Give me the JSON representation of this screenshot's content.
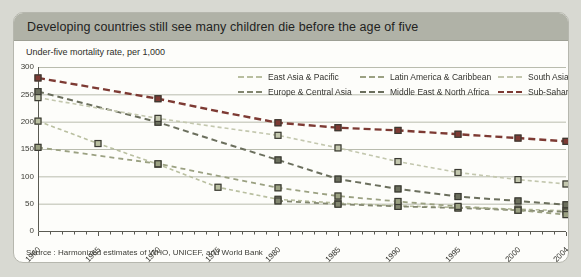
{
  "page": {
    "background": "#d8d9d2"
  },
  "header": {
    "title": "Developing countries still see many children die before the age of five"
  },
  "subtitle": "Under-five mortality rate, per 1,000",
  "source": "Source : Harmonized estimates of WHO, UNICEF, and World Bank",
  "chart_data": {
    "type": "line",
    "title": "Developing countries still see many children die before the age of five",
    "ylabel": "Under-five mortality rate, per 1,000",
    "xlabel": "",
    "x": [
      1960,
      1965,
      1970,
      1975,
      1980,
      1985,
      1990,
      1995,
      2000,
      2004
    ],
    "x_tick_labels": [
      "1960",
      "1965",
      "1970",
      "1975",
      "1980",
      "1985",
      "1990",
      "1995",
      "2000",
      "2004"
    ],
    "x_minor_tick_step": 1,
    "x_range": [
      1960,
      2004
    ],
    "ylim": [
      0,
      300
    ],
    "yticks": [
      0,
      50,
      100,
      150,
      200,
      250,
      300
    ],
    "grid": true,
    "grid_color": "#b9bcae",
    "axis_color": "#5a5a52",
    "marker_shape": "square",
    "marker_border_color": "#3a3a33",
    "legend_position": "top-center",
    "legend_rows": 2,
    "series": [
      {
        "name": "East Asia & Pacific",
        "color": "#b9bfa0",
        "dash": [
          4,
          3
        ],
        "line_width": 1.6,
        "values": [
          201,
          160,
          122,
          80,
          58,
          51,
          46,
          43,
          40,
          37
        ],
        "marker_years": [
          1960,
          1965,
          1970,
          1975,
          1980,
          1985,
          1990,
          1995,
          2000,
          2004
        ]
      },
      {
        "name": "Europe & Central Asia",
        "color": "#82866f",
        "dash": [
          5,
          4
        ],
        "line_width": 1.8,
        "values": [
          null,
          null,
          null,
          null,
          55,
          49,
          45,
          42,
          38,
          35
        ],
        "marker_years": [
          1980,
          1985,
          1990,
          1995,
          2000,
          2004
        ]
      },
      {
        "name": "Latin America & Caribbean",
        "color": "#9ba182",
        "dash": [
          5,
          4
        ],
        "line_width": 1.8,
        "values": [
          153,
          138,
          123,
          101,
          79,
          64,
          54,
          45,
          38,
          30
        ],
        "marker_years": [
          1960,
          1970,
          1980,
          1985,
          1990,
          1995,
          2000,
          2004
        ]
      },
      {
        "name": "Middle East & North Africa",
        "color": "#6b6f5d",
        "dash": [
          6,
          4
        ],
        "line_width": 2,
        "values": [
          255,
          227,
          199,
          164,
          130,
          95,
          77,
          63,
          55,
          48
        ],
        "marker_years": [
          1960,
          1970,
          1980,
          1985,
          1990,
          1995,
          2000,
          2004
        ]
      },
      {
        "name": "South Asia",
        "color": "#c3c7ae",
        "dash": [
          4,
          3
        ],
        "line_width": 1.6,
        "values": [
          244,
          225,
          206,
          190,
          175,
          152,
          127,
          107,
          94,
          86
        ],
        "marker_years": [
          1960,
          1970,
          1980,
          1985,
          1990,
          1995,
          2000,
          2004
        ]
      },
      {
        "name": "Sub-Saharan Africa",
        "color": "#7d3a33",
        "dash": [
          7,
          4
        ],
        "line_width": 2.4,
        "values": [
          280,
          261,
          242,
          219,
          198,
          189,
          184,
          177,
          170,
          164
        ],
        "marker_years": [
          1960,
          1970,
          1980,
          1985,
          1990,
          1995,
          2000,
          2004
        ]
      }
    ]
  }
}
